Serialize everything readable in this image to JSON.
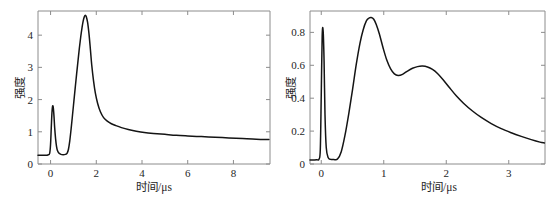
{
  "figure": {
    "background_color": "#ffffff",
    "curve_color": "#141414",
    "axis_color": "#8c8c8c"
  },
  "chart_data": [
    {
      "id": "left",
      "type": "line",
      "title": "",
      "xlabel": "时间/μs",
      "ylabel": "强度",
      "xlim": [
        -0.55,
        9.6
      ],
      "ylim": [
        0.0,
        4.75
      ],
      "xticks": [
        0,
        2,
        4,
        6,
        8
      ],
      "xticklabels": [
        "0",
        "2",
        "4",
        "6",
        "8"
      ],
      "yticks": [
        0,
        1,
        2,
        3,
        4
      ],
      "yticklabels": [
        "0",
        "1",
        "2",
        "3",
        "4"
      ],
      "grid": false,
      "legend": null,
      "series": [
        {
          "name": "intensity",
          "x": [
            -0.55,
            -0.4,
            -0.25,
            -0.12,
            -0.04,
            0.0,
            0.03,
            0.06,
            0.09,
            0.12,
            0.15,
            0.18,
            0.22,
            0.26,
            0.3,
            0.36,
            0.45,
            0.55,
            0.65,
            0.72,
            0.78,
            0.84,
            0.9,
            0.96,
            1.02,
            1.08,
            1.14,
            1.2,
            1.26,
            1.32,
            1.38,
            1.43,
            1.48,
            1.52,
            1.56,
            1.62,
            1.68,
            1.74,
            1.8,
            1.88,
            1.96,
            2.06,
            2.18,
            2.32,
            2.48,
            2.66,
            2.86,
            3.1,
            3.4,
            3.75,
            4.1,
            4.5,
            5.0,
            5.5,
            6.0,
            6.6,
            7.2,
            7.8,
            8.4,
            9.0,
            9.55
          ],
          "y": [
            0.27,
            0.27,
            0.27,
            0.28,
            0.33,
            0.62,
            1.12,
            1.58,
            1.8,
            1.74,
            1.48,
            1.12,
            0.78,
            0.55,
            0.42,
            0.34,
            0.3,
            0.29,
            0.3,
            0.33,
            0.45,
            0.72,
            1.1,
            1.52,
            1.95,
            2.38,
            2.8,
            3.2,
            3.6,
            3.95,
            4.25,
            4.45,
            4.58,
            4.62,
            4.58,
            4.4,
            4.05,
            3.58,
            3.08,
            2.58,
            2.2,
            1.88,
            1.62,
            1.44,
            1.33,
            1.25,
            1.19,
            1.13,
            1.07,
            1.02,
            0.98,
            0.95,
            0.92,
            0.89,
            0.87,
            0.85,
            0.83,
            0.81,
            0.79,
            0.77,
            0.76
          ]
        }
      ]
    },
    {
      "id": "right",
      "type": "line",
      "title": "",
      "xlabel": "时间/μs",
      "ylabel": "强度",
      "xlim": [
        -0.18,
        3.58
      ],
      "ylim": [
        0.0,
        0.93
      ],
      "xticks": [
        0,
        1,
        2,
        3
      ],
      "xticklabels": [
        "0",
        "1",
        "2",
        "3"
      ],
      "yticks": [
        0,
        0.2,
        0.4,
        0.6,
        0.8
      ],
      "yticklabels": [
        "0",
        "0.2",
        "0.4",
        "0.6",
        "0.8"
      ],
      "grid": false,
      "legend": null,
      "series": [
        {
          "name": "intensity",
          "x": [
            -0.18,
            -0.12,
            -0.07,
            -0.035,
            -0.015,
            0.0,
            0.015,
            0.03,
            0.045,
            0.06,
            0.08,
            0.11,
            0.15,
            0.2,
            0.26,
            0.32,
            0.38,
            0.44,
            0.5,
            0.56,
            0.62,
            0.67,
            0.72,
            0.76,
            0.8,
            0.84,
            0.88,
            0.93,
            0.99,
            1.05,
            1.11,
            1.17,
            1.23,
            1.3,
            1.38,
            1.46,
            1.54,
            1.62,
            1.7,
            1.78,
            1.86,
            1.95,
            2.05,
            2.16,
            2.28,
            2.42,
            2.56,
            2.72,
            2.88,
            3.04,
            3.2,
            3.36,
            3.5,
            3.57
          ],
          "y": [
            0.025,
            0.025,
            0.026,
            0.03,
            0.09,
            0.42,
            0.78,
            0.81,
            0.63,
            0.3,
            0.1,
            0.04,
            0.028,
            0.027,
            0.03,
            0.075,
            0.175,
            0.305,
            0.45,
            0.605,
            0.735,
            0.815,
            0.868,
            0.886,
            0.89,
            0.88,
            0.848,
            0.79,
            0.705,
            0.63,
            0.578,
            0.548,
            0.538,
            0.545,
            0.565,
            0.582,
            0.592,
            0.595,
            0.59,
            0.575,
            0.55,
            0.512,
            0.465,
            0.415,
            0.368,
            0.322,
            0.283,
            0.246,
            0.215,
            0.19,
            0.168,
            0.148,
            0.133,
            0.128
          ]
        }
      ]
    }
  ]
}
